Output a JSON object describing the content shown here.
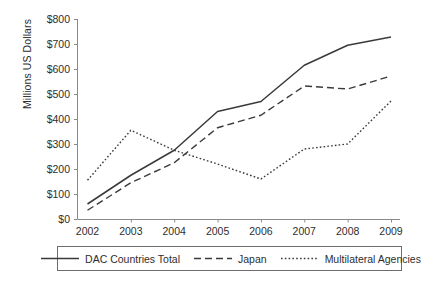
{
  "chart_data": {
    "type": "line",
    "title": "",
    "xlabel": "",
    "ylabel": "Millions US Dollars",
    "categories": [
      "2002",
      "2003",
      "2004",
      "2005",
      "2006",
      "2007",
      "2008",
      "2009"
    ],
    "x": [
      2002,
      2003,
      2004,
      2005,
      2006,
      2007,
      2008,
      2009
    ],
    "xlim": [
      2002,
      2009
    ],
    "ylim": [
      0,
      800
    ],
    "y_ticks": [
      0,
      100,
      200,
      300,
      400,
      500,
      600,
      700,
      800
    ],
    "y_tick_labels": [
      "$0",
      "$100",
      "$200",
      "$300",
      "$400",
      "$500",
      "$600",
      "$700",
      "$800"
    ],
    "grid": false,
    "legend_position": "bottom",
    "series": [
      {
        "name": "DAC Countries Total",
        "style": "solid",
        "color": "#3a3a3a",
        "values": [
          60,
          175,
          275,
          430,
          470,
          615,
          695,
          728
        ]
      },
      {
        "name": "Japan",
        "style": "dashed",
        "color": "#3a3a3a",
        "values": [
          35,
          145,
          225,
          365,
          415,
          532,
          520,
          572
        ]
      },
      {
        "name": "Multilateral Agencies",
        "style": "dotted",
        "color": "#3a3a3a",
        "values": [
          155,
          355,
          275,
          220,
          160,
          280,
          300,
          472
        ]
      }
    ]
  },
  "axis": {
    "y_title": "Millions US Dollars",
    "y_tick_labels": [
      "$800",
      "$700",
      "$600",
      "$500",
      "$400",
      "$300",
      "$200",
      "$100",
      "$0"
    ],
    "x_tick_labels": [
      "2002",
      "2003",
      "2004",
      "2005",
      "2006",
      "2007",
      "2008",
      "2009"
    ]
  },
  "legend": {
    "items": [
      {
        "label": "DAC Countries Total",
        "style": "solid"
      },
      {
        "label": "Japan",
        "style": "dashed"
      },
      {
        "label": "Multilateral Agencies",
        "style": "dotted"
      }
    ]
  }
}
